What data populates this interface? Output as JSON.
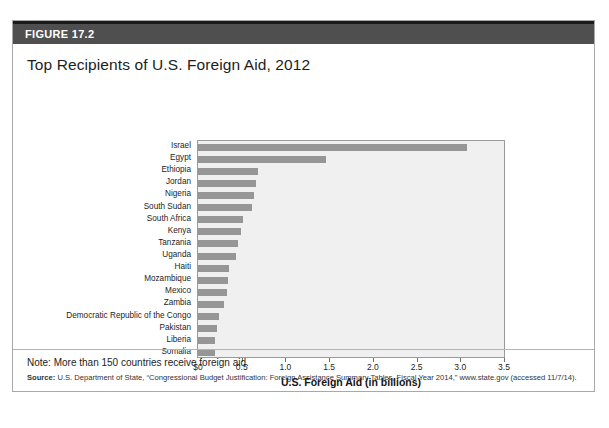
{
  "figure": {
    "header_label": "FIGURE 17.2",
    "title": "Top Recipients of U.S. Foreign Aid, 2012",
    "note": "Note: More than 150 countries receive foreign aid.",
    "source_label": "Source:",
    "source_text": " U.S. Department of State, “Congressional Budget Justification: Foreign Assistance Summary Tables, Fiscal Year 2014,” www.state.gov (accessed 11/7/14)."
  },
  "colors": {
    "header_band": "#4f4f4f",
    "header_rule": "#1a1a1a",
    "bar": "#969696",
    "plot_background": "#f0f0f0",
    "plot_border": "#9a9a9a",
    "card_border": "#a8a8a8"
  },
  "chart_data": {
    "type": "bar",
    "orientation": "horizontal",
    "title": "Top Recipients of U.S. Foreign Aid, 2012",
    "xlabel": "U.S. Foreign Aid (in billions)",
    "ylabel": "",
    "xlim": [
      0,
      3.5
    ],
    "xticks": [
      0,
      0.5,
      1.0,
      1.5,
      2.0,
      2.5,
      3.0,
      3.5
    ],
    "xticklabels": [
      "$0",
      "0.5",
      "1.0",
      "1.5",
      "2.0",
      "2.5",
      "3.0",
      "3.5"
    ],
    "grid": false,
    "legend": null,
    "categories": [
      "Israel",
      "Egypt",
      "Ethiopia",
      "Jordan",
      "Nigeria",
      "South Sudan",
      "South Africa",
      "Kenya",
      "Tanzania",
      "Uganda",
      "Haiti",
      "Mozambique",
      "Mexico",
      "Zambia",
      "Democratic Republic of the Congo",
      "Pakistan",
      "Liberia",
      "Somalia"
    ],
    "values": [
      3.08,
      1.46,
      0.69,
      0.66,
      0.64,
      0.62,
      0.51,
      0.49,
      0.46,
      0.43,
      0.35,
      0.34,
      0.33,
      0.3,
      0.24,
      0.22,
      0.2,
      0.19
    ]
  }
}
